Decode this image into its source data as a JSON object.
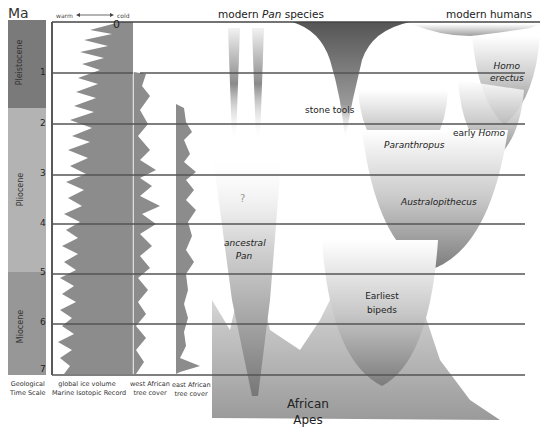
{
  "axis": {
    "unit_label": "Ma",
    "ticks": [
      "0",
      "1",
      "2",
      "3",
      "4",
      "5",
      "6",
      "7"
    ]
  },
  "geological_time_scale": {
    "caption_line1": "Geological",
    "caption_line2": "Time Scale",
    "epochs": [
      {
        "name": "Pleistocene",
        "color": "#7a7a7a"
      },
      {
        "name": "Pliocene",
        "color": "#b3b3b3"
      },
      {
        "name": "Miocene",
        "color": "#979797"
      }
    ]
  },
  "ice_volume": {
    "header_warm": "warm",
    "header_cold": "cold",
    "caption_line1": "global ice volume",
    "caption_line2": "Marine Isotopic Record"
  },
  "west_african": {
    "caption_line1": "west African",
    "caption_line2": "tree cover"
  },
  "east_african": {
    "caption_line1": "east African",
    "caption_line2": "tree cover"
  },
  "lineages": {
    "modern_pan_prefix": "modern ",
    "modern_pan_italic": "Pan",
    "modern_pan_suffix": " species",
    "modern_humans": "modern humans",
    "stone_tools": "stone tools",
    "homo_erectus_1": "Homo",
    "homo_erectus_2": "erectus",
    "early_homo_prefix": "early ",
    "early_homo_italic": "Homo",
    "paranthropus": "Paranthropus",
    "australopithecus": "Australopithecus",
    "question": "?",
    "ancestral_pan_1": "ancestral",
    "ancestral_pan_2": "Pan",
    "earliest_bipeds_1": "Earliest",
    "earliest_bipeds_2": "bipeds",
    "african_apes_1": "African",
    "african_apes_2": "Apes"
  },
  "colors": {
    "line": "#555555",
    "series_fill": "#8c8c8c",
    "dark_fill": "#6e6e6e"
  }
}
